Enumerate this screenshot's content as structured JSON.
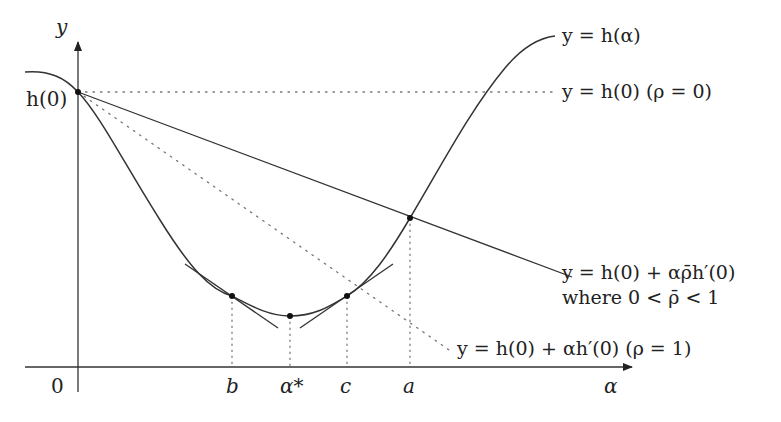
{
  "diagram": {
    "axes": {
      "y_label": "y",
      "x_label": "α",
      "origin_label": "0",
      "y_tick_label": "h(0)"
    },
    "x_ticks": [
      {
        "id": "b",
        "label": "b"
      },
      {
        "id": "alpha_star",
        "label": "α*"
      },
      {
        "id": "c",
        "label": "c"
      },
      {
        "id": "a",
        "label": "a"
      }
    ],
    "curves": {
      "h": {
        "label": "y = h(α)"
      },
      "horizontal": {
        "label": "y = h(0)  (ρ = 0)"
      },
      "relaxed_line": {
        "label": "y = h(0) + αρ̄h′(0)",
        "note": "where 0 < ρ̄ < 1"
      },
      "tangent_line": {
        "label": "y = h(0) + αh′(0)  (ρ = 1)"
      }
    },
    "colors": {
      "stroke": "#333333",
      "dotted": "#777777",
      "background": "#ffffff"
    }
  }
}
